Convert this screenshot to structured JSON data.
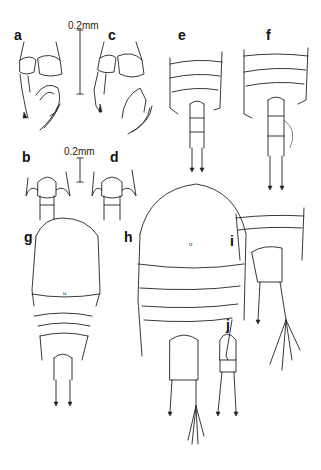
{
  "figure": {
    "panels": {
      "a": "a",
      "b": "b",
      "c": "c",
      "d": "d",
      "e": "e",
      "f": "f",
      "g": "g",
      "h": "h",
      "i": "i",
      "j": "j"
    },
    "scale_bars": {
      "top": "0.2mm",
      "middle": "0.2mm"
    }
  }
}
